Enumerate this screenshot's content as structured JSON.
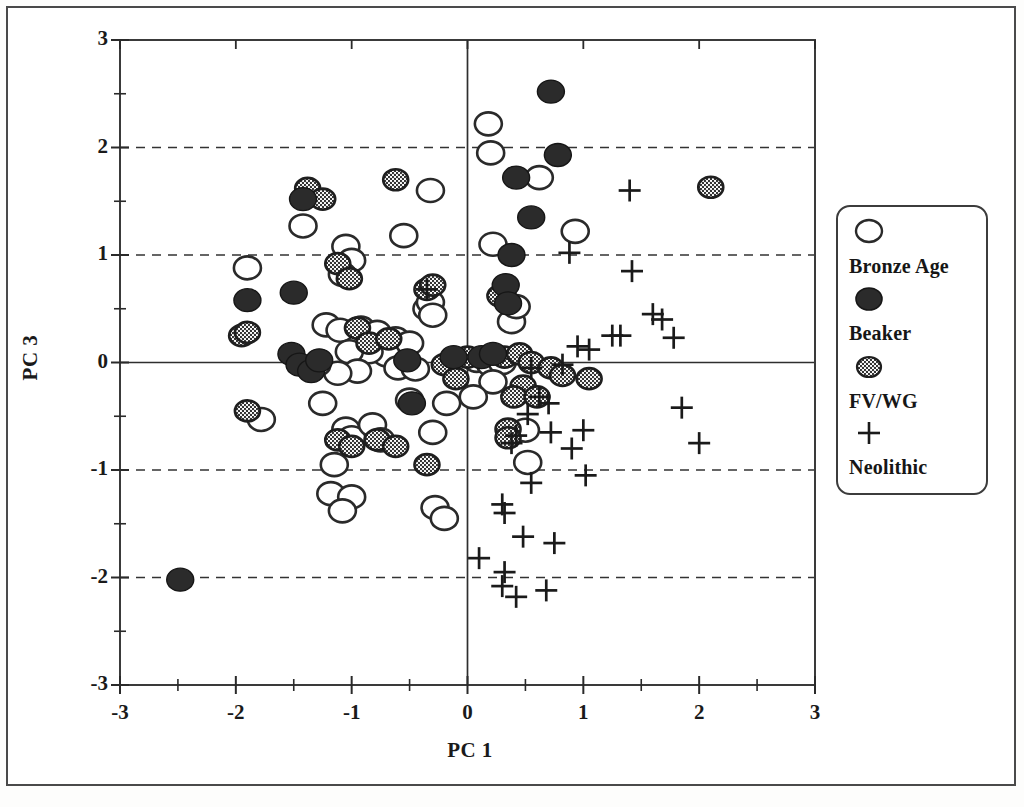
{
  "figure": {
    "title": "",
    "background_color": "#ffffff",
    "frame_color": "#4a4a4a"
  },
  "chart_data": {
    "type": "scatter",
    "title": "",
    "xlabel": "PC 1",
    "ylabel": "PC 3",
    "xlim": [
      -3,
      3
    ],
    "ylim": [
      -3,
      3
    ],
    "xticks": [
      -3,
      -2,
      -1,
      0,
      1,
      2,
      3
    ],
    "yticks": [
      -3,
      -2,
      -1,
      0,
      1,
      2,
      3
    ],
    "xtick_labels": [
      "-3",
      "-2",
      "-1",
      "0",
      "1",
      "2",
      "3"
    ],
    "ytick_labels": [
      "-3",
      "-2",
      "-1",
      "0",
      "1",
      "2",
      "3"
    ],
    "minor_tick_step": 0.5,
    "grid": {
      "dashed_horizontal_at": [
        2,
        1,
        -1,
        -2
      ],
      "solid_horizontal_at": [
        0
      ],
      "solid_vertical_at": [
        0
      ],
      "color": "#333333"
    },
    "legend": {
      "position": "right-outside",
      "entries": [
        {
          "label": "Bronze Age",
          "marker": "open-circle"
        },
        {
          "label": "Beaker",
          "marker": "filled-circle"
        },
        {
          "label": "FV/WG",
          "marker": "hatched-circle"
        },
        {
          "label": "Neolithic",
          "marker": "plus"
        }
      ]
    },
    "series": [
      {
        "name": "Bronze Age",
        "marker": "open-circle",
        "color": "#ffffff",
        "edge_color": "#2a2a2a",
        "points": [
          [
            0.18,
            2.22
          ],
          [
            0.2,
            1.95
          ],
          [
            0.62,
            1.72
          ],
          [
            0.93,
            1.22
          ],
          [
            -0.55,
            1.18
          ],
          [
            -1.42,
            1.27
          ],
          [
            0.22,
            1.1
          ],
          [
            -1.05,
            1.08
          ],
          [
            -0.32,
            1.6
          ],
          [
            -1.0,
            0.95
          ],
          [
            -1.08,
            0.82
          ],
          [
            -1.9,
            0.88
          ],
          [
            -1.22,
            0.35
          ],
          [
            -1.1,
            0.3
          ],
          [
            -0.92,
            0.32
          ],
          [
            -0.78,
            0.28
          ],
          [
            -0.62,
            0.22
          ],
          [
            -0.5,
            0.18
          ],
          [
            -0.35,
            0.5
          ],
          [
            -0.32,
            0.56
          ],
          [
            -0.3,
            0.44
          ],
          [
            -0.7,
            0.07
          ],
          [
            -0.85,
            0.1
          ],
          [
            -1.02,
            0.1
          ],
          [
            -0.6,
            -0.05
          ],
          [
            -0.45,
            -0.06
          ],
          [
            -0.95,
            -0.08
          ],
          [
            -1.12,
            -0.1
          ],
          [
            -1.3,
            -0.02
          ],
          [
            0.08,
            0.02
          ],
          [
            0.2,
            -0.02
          ],
          [
            0.3,
            0.0
          ],
          [
            0.22,
            -0.18
          ],
          [
            0.05,
            -0.32
          ],
          [
            -0.18,
            -0.38
          ],
          [
            -1.25,
            -0.38
          ],
          [
            -1.78,
            -0.53
          ],
          [
            -0.5,
            -0.35
          ],
          [
            -1.05,
            -0.62
          ],
          [
            -1.0,
            -0.7
          ],
          [
            -0.82,
            -0.58
          ],
          [
            -0.75,
            -0.72
          ],
          [
            -1.15,
            -0.95
          ],
          [
            -1.18,
            -1.22
          ],
          [
            -1.0,
            -1.25
          ],
          [
            -1.08,
            -1.38
          ],
          [
            -0.28,
            -1.35
          ],
          [
            -0.2,
            -1.45
          ],
          [
            0.52,
            -0.93
          ],
          [
            0.5,
            -0.63
          ],
          [
            -0.3,
            -0.65
          ],
          [
            0.38,
            0.38
          ],
          [
            0.42,
            0.52
          ],
          [
            0.3,
            0.62
          ]
        ]
      },
      {
        "name": "Beaker",
        "marker": "filled-circle",
        "color": "#2b2b2b",
        "edge_color": "#161616",
        "points": [
          [
            0.72,
            2.52
          ],
          [
            0.78,
            1.93
          ],
          [
            0.42,
            1.72
          ],
          [
            0.55,
            1.35
          ],
          [
            -1.42,
            1.52
          ],
          [
            0.38,
            1.0
          ],
          [
            0.33,
            0.72
          ],
          [
            -1.9,
            0.58
          ],
          [
            -1.5,
            0.65
          ],
          [
            -1.52,
            0.08
          ],
          [
            -1.45,
            -0.02
          ],
          [
            -1.35,
            -0.08
          ],
          [
            -0.52,
            0.02
          ],
          [
            -0.48,
            -0.38
          ],
          [
            -2.48,
            -2.02
          ],
          [
            0.12,
            0.05
          ],
          [
            0.22,
            0.08
          ],
          [
            -0.12,
            0.05
          ],
          [
            -1.28,
            0.02
          ],
          [
            0.35,
            0.55
          ]
        ]
      },
      {
        "name": "FV/WG",
        "marker": "hatched-circle",
        "color": "#8a8a8a",
        "edge_color": "#1f1f1f",
        "points": [
          [
            2.1,
            1.63
          ],
          [
            -0.62,
            1.7
          ],
          [
            -1.38,
            1.62
          ],
          [
            -1.25,
            1.52
          ],
          [
            -1.95,
            0.25
          ],
          [
            -1.9,
            0.28
          ],
          [
            -1.12,
            0.92
          ],
          [
            -1.02,
            0.78
          ],
          [
            -0.95,
            0.32
          ],
          [
            -0.85,
            0.18
          ],
          [
            -0.68,
            0.22
          ],
          [
            -0.35,
            0.68
          ],
          [
            -0.3,
            0.72
          ],
          [
            0.28,
            0.62
          ],
          [
            0.32,
            0.05
          ],
          [
            0.45,
            0.08
          ],
          [
            0.55,
            0.0
          ],
          [
            0.72,
            -0.05
          ],
          [
            0.82,
            -0.12
          ],
          [
            1.05,
            -0.15
          ],
          [
            0.48,
            -0.22
          ],
          [
            0.4,
            -0.32
          ],
          [
            0.35,
            -0.62
          ],
          [
            0.35,
            -0.7
          ],
          [
            -1.9,
            -0.45
          ],
          [
            -1.12,
            -0.72
          ],
          [
            -1.0,
            -0.78
          ],
          [
            -0.78,
            -0.72
          ],
          [
            -0.62,
            -0.78
          ],
          [
            -0.35,
            -0.95
          ],
          [
            -0.2,
            -0.02
          ],
          [
            0.0,
            0.05
          ],
          [
            -0.1,
            -0.15
          ],
          [
            0.6,
            -0.32
          ]
        ]
      },
      {
        "name": "Neolithic",
        "marker": "plus",
        "color": "#1a1a1a",
        "points": [
          [
            1.4,
            1.6
          ],
          [
            0.88,
            1.02
          ],
          [
            1.42,
            0.85
          ],
          [
            1.6,
            0.45
          ],
          [
            1.68,
            0.4
          ],
          [
            1.78,
            0.23
          ],
          [
            1.25,
            0.25
          ],
          [
            1.32,
            0.25
          ],
          [
            0.95,
            0.15
          ],
          [
            1.05,
            0.12
          ],
          [
            0.82,
            -0.02
          ],
          [
            0.55,
            -0.05
          ],
          [
            0.62,
            -0.32
          ],
          [
            0.7,
            -0.38
          ],
          [
            0.52,
            -0.48
          ],
          [
            0.72,
            -0.65
          ],
          [
            1.0,
            -0.63
          ],
          [
            1.85,
            -0.42
          ],
          [
            2.0,
            -0.75
          ],
          [
            0.9,
            -0.8
          ],
          [
            1.02,
            -1.05
          ],
          [
            0.55,
            -1.12
          ],
          [
            0.3,
            -1.32
          ],
          [
            0.32,
            -1.4
          ],
          [
            0.48,
            -1.62
          ],
          [
            0.75,
            -1.68
          ],
          [
            0.1,
            -1.82
          ],
          [
            0.32,
            -1.95
          ],
          [
            0.3,
            -2.08
          ],
          [
            0.42,
            -2.18
          ],
          [
            0.68,
            -2.12
          ],
          [
            -0.35,
            0.68
          ],
          [
            0.42,
            -0.68
          ],
          [
            0.38,
            -0.75
          ]
        ]
      }
    ]
  },
  "axes": {
    "x_title": "PC 1",
    "y_title": "PC 3",
    "x_tick_labels": [
      "-3",
      "-2",
      "-1",
      "0",
      "1",
      "2",
      "3"
    ],
    "y_tick_labels": [
      "3",
      "2",
      "1",
      "0",
      "-1",
      "-2",
      "-3"
    ]
  },
  "legend": {
    "entries": [
      {
        "label": "Bronze Age",
        "marker": "open-circle"
      },
      {
        "label": "Beaker",
        "marker": "filled-circle"
      },
      {
        "label": "FV/WG",
        "marker": "hatched-circle"
      },
      {
        "label": "Neolithic",
        "marker": "plus"
      }
    ]
  }
}
